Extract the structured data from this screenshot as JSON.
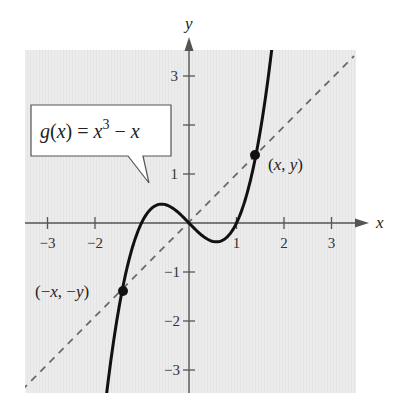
{
  "chart_data": {
    "type": "line",
    "title": "",
    "xlabel": "x",
    "ylabel": "y",
    "xlim": [
      -3.5,
      3.5
    ],
    "ylim": [
      -3.5,
      3.5
    ],
    "grid": false,
    "x_ticks": [
      "-3",
      "-2",
      "1",
      "2",
      "3"
    ],
    "y_ticks": [
      "3",
      "1",
      "-1",
      "-2",
      "-3"
    ],
    "series": [
      {
        "name": "g(x) = x^3 - x",
        "style": "solid",
        "color": "#111111",
        "function": "x^3 - x",
        "x": [
          -1.73,
          -1.5,
          -1.0,
          -0.577,
          0,
          0.577,
          1.0,
          1.5,
          1.73
        ],
        "y": [
          -3.45,
          -1.875,
          0,
          0.385,
          0,
          -0.385,
          0,
          1.875,
          3.45
        ]
      },
      {
        "name": "y = x",
        "style": "dashed",
        "color": "#666666",
        "x": [
          -3.5,
          3.5
        ],
        "y": [
          -3.5,
          3.5
        ]
      }
    ],
    "points": [
      {
        "label": "(x, y)",
        "x": 1.39,
        "y": 1.3
      },
      {
        "label": "(−x, −y)",
        "x": -1.39,
        "y": -1.3
      }
    ],
    "annotations": [
      {
        "text": "g(x) = x³ − x",
        "type": "callout-box"
      }
    ]
  },
  "labels": {
    "axis_x": "x",
    "axis_y": "y",
    "x_ticks": [
      "−3",
      "−2",
      "1",
      "2",
      "3"
    ],
    "y_ticks": [
      "3",
      "1",
      "−1",
      "−2",
      "−3"
    ],
    "callout": {
      "g": "g",
      "paren_open": "(",
      "x1": "x",
      "paren_close": ")",
      "eq": " = ",
      "x2": "x",
      "exp": "3",
      "minus": " − ",
      "x3": "x"
    },
    "point_pos": {
      "paren_open": "(",
      "x": "x",
      "comma": ", ",
      "y": "y",
      "paren_close": ")"
    },
    "point_neg": {
      "paren_open": "(−",
      "x": "x",
      "comma": ", −",
      "y": "y",
      "paren_close": ")"
    }
  },
  "colors": {
    "plot_bg": "#ececec",
    "axis": "#555555",
    "curve": "#111111",
    "dashed": "#6a6a6a"
  }
}
